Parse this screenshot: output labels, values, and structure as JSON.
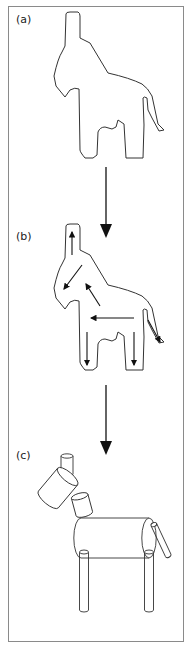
{
  "figure": {
    "width": 192,
    "height": 648,
    "frame": {
      "x": 8,
      "y": 6,
      "w": 176,
      "h": 636,
      "color": "#8a8a8a"
    },
    "stroke_color": "#333333",
    "arrow_color": "#111111"
  },
  "panels": [
    {
      "id": "a",
      "label": "(a)",
      "label_pos": [
        16,
        13
      ],
      "description": "donkey silhouette outline"
    },
    {
      "id": "b",
      "label": "(b)",
      "label_pos": [
        16,
        230
      ],
      "description": "silhouette with part-axis arrows"
    },
    {
      "id": "c",
      "label": "(c)",
      "label_pos": [
        16,
        449
      ],
      "description": "generalized-cylinder part decomposition"
    }
  ],
  "silhouette": {
    "path": "M66,14 Q66,12 70,12 L78,12 Q80,13 80,16 L80,38 L90,43 L108,73 Q130,78 142,84 Q148,88 152,96 L158,124 L164,130 L159,131 L152,118 L148,110 L147,98 Q144,96 143,98 L144,125 L143,158 L126,158 L124,124 L118,120 L116,127 L112,129 L105,127 Q100,127 98,132 L97,155 L93,158 L85,158 Q80,152 80,150 L79,89 Q75,87 70,90 L65,97 L56,86 L54,76 Q58,58 62,52 L65,46 Z",
    "panel_a_offset": [
      0,
      0
    ],
    "panel_b_offset": [
      0,
      212
    ]
  },
  "panel_b_arrows": [
    {
      "x1": 72,
      "y1": 255,
      "x2": 72,
      "y2": 232,
      "name": "head-up-arrow"
    },
    {
      "x1": 82,
      "y1": 265,
      "x2": 64,
      "y2": 289,
      "name": "neck-diagonal-arrow"
    },
    {
      "x1": 100,
      "y1": 306,
      "x2": 86,
      "y2": 284,
      "name": "body-diagonal-arrow"
    },
    {
      "x1": 134,
      "y1": 318,
      "x2": 91,
      "y2": 318,
      "name": "body-horizontal-arrow"
    },
    {
      "x1": 87,
      "y1": 332,
      "x2": 87,
      "y2": 365,
      "name": "front-leg-down-arrow"
    },
    {
      "x1": 134,
      "y1": 332,
      "x2": 134,
      "y2": 365,
      "name": "hind-leg-down-arrow"
    },
    {
      "x1": 148,
      "y1": 320,
      "x2": 160,
      "y2": 342,
      "name": "tail-diagonal-arrow"
    }
  ],
  "flow_arrows": [
    {
      "x": 106,
      "y1": 167,
      "y2": 238,
      "name": "arrow-a-to-b"
    },
    {
      "x": 106,
      "y1": 385,
      "y2": 455,
      "name": "arrow-b-to-c"
    }
  ],
  "cylinders": [
    {
      "name": "ear-cylinder",
      "cx": 67,
      "cy": 465,
      "w": 12,
      "h": 18,
      "angle": 0
    },
    {
      "name": "head-cylinder",
      "cx": 58,
      "cy": 488,
      "w": 26,
      "h": 30,
      "angle": 40
    },
    {
      "name": "neck-cylinder",
      "cx": 82,
      "cy": 505,
      "w": 17,
      "h": 18,
      "angle": -15
    },
    {
      "name": "body-cylinder",
      "cx": 115,
      "cy": 538,
      "w": 40,
      "h": 68,
      "angle": 90
    },
    {
      "name": "tail-cylinder",
      "cx": 161,
      "cy": 540,
      "w": 6,
      "h": 34,
      "angle": -25
    },
    {
      "name": "front-leg-cylinder",
      "cx": 84,
      "cy": 581,
      "w": 9,
      "h": 58,
      "angle": 0
    },
    {
      "name": "hind-leg-cylinder",
      "cx": 149,
      "cy": 581,
      "w": 9,
      "h": 58,
      "angle": 0
    }
  ]
}
